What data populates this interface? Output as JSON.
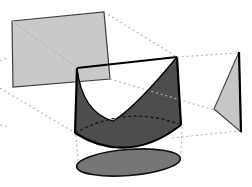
{
  "canvas": {
    "width": 252,
    "height": 187,
    "background": "#ffffff"
  },
  "colors": {
    "background": "#ffffff",
    "projection_plane_fill": "#c9c9c9",
    "projection_plane_stroke": "#3f3f3f",
    "solid_lateral_fill": "#4d4d4d",
    "solid_front_face_fill": "#ffffff",
    "solid_edge_stroke": "#000000",
    "side_triangle_fill": "#c6c6c6",
    "side_triangle_stroke": "#4a4a4a",
    "shadow_ellipse_fill": "#767676",
    "shadow_ellipse_stroke": "#111111",
    "projection_ray_color": "#b4b4b4",
    "hidden_edge_color": "#111111"
  },
  "figure": {
    "description_names": [
      "back-projection-plane",
      "parabolic-cylinder-solid",
      "side-projection-triangle",
      "bottom-shadow-ellipse",
      "projection-rays-dotted"
    ]
  },
  "layers": [
    {
      "name": "solid-front-face",
      "type": "path",
      "d": "M 77,68 L 177,57 Q 135,108 113,121 Q 82,112 77,68 Z",
      "fill": "#ffffff"
    },
    {
      "name": "back-projection-plane",
      "type": "polygon",
      "points": "12,21 104,12 110,79 13,87",
      "fill": "#c9c9c9",
      "stroke": "#3f3f3f",
      "stroke_width": 1.2
    },
    {
      "name": "ray-back-top-left",
      "type": "line",
      "x1": 12,
      "y1": 21,
      "x2": 77,
      "y2": 68,
      "stroke": "#b4b4b4",
      "stroke_width": 1.1,
      "dash": "2,2.8"
    },
    {
      "name": "ray-back-top-right",
      "type": "line",
      "x1": 104,
      "y1": 12,
      "x2": 177,
      "y2": 57,
      "stroke": "#b4b4b4",
      "stroke_width": 1.1,
      "dash": "2,2.8"
    },
    {
      "name": "ray-back-bottom-left",
      "type": "line",
      "x1": 0,
      "y1": 88,
      "x2": 75,
      "y2": 133,
      "stroke": "#b4b4b4",
      "stroke_width": 1.1,
      "dash": "2,2.8"
    },
    {
      "name": "ray-stub-left-top",
      "type": "line",
      "x1": 0,
      "y1": 61,
      "x2": 9,
      "y2": 57,
      "stroke": "#b4b4b4",
      "stroke_width": 1.1,
      "dash": "2,2.8"
    },
    {
      "name": "ray-stub-left-bottom",
      "type": "line",
      "x1": 0,
      "y1": 125,
      "x2": 9,
      "y2": 127,
      "stroke": "#b4b4b4",
      "stroke_width": 1.1,
      "dash": "2,2.8"
    },
    {
      "name": "solid-lateral-surface",
      "type": "path",
      "d": "M 77,68 L 177,57 L 181,125 Q 128,166 75,133 Z M 77,68 Q 82,112 113,121 Q 135,108 177,57 Z",
      "fill": "#4d4d4d",
      "fill_rule": "evenodd"
    },
    {
      "name": "ray-side-middle",
      "type": "line",
      "x1": 110,
      "y1": 79,
      "x2": 214,
      "y2": 110,
      "stroke": "#b4b4b4",
      "stroke_width": 1.1,
      "dash": "2,2.8"
    },
    {
      "name": "solid-hidden-bottom-rim",
      "type": "path",
      "d": "M 75,133 Q 128,104 181,125",
      "fill": "none",
      "stroke": "#111111",
      "stroke_width": 1.2,
      "dash": "3,2.6"
    },
    {
      "name": "solid-edge-top",
      "type": "path",
      "d": "M 77,68 L 177,57",
      "fill": "none",
      "stroke": "#000000",
      "stroke_width": 2.2
    },
    {
      "name": "solid-edge-left",
      "type": "path",
      "d": "M 77,68 L 75,133",
      "fill": "none",
      "stroke": "#000000",
      "stroke_width": 2.2
    },
    {
      "name": "solid-edge-right",
      "type": "path",
      "d": "M 177,57 L 181,125",
      "fill": "none",
      "stroke": "#000000",
      "stroke_width": 2.2
    },
    {
      "name": "solid-edge-bottom-rim",
      "type": "path",
      "d": "M 75,133 Q 128,166 181,125",
      "fill": "none",
      "stroke": "#000000",
      "stroke_width": 2.2
    },
    {
      "name": "solid-parabola-curve",
      "type": "path",
      "d": "M 177,57 Q 135,108 113,121 Q 82,112 77,68",
      "fill": "none",
      "stroke": "#000000",
      "stroke_width": 1.3
    },
    {
      "name": "ray-side-top",
      "type": "line",
      "x1": 177,
      "y1": 57,
      "x2": 239,
      "y2": 53,
      "stroke": "#b4b4b4",
      "stroke_width": 1.1,
      "dash": "2,2.8"
    },
    {
      "name": "ray-side-bottom",
      "type": "line",
      "x1": 172,
      "y1": 138,
      "x2": 239,
      "y2": 131,
      "stroke": "#b4b4b4",
      "stroke_width": 1.1,
      "dash": "2,2.8"
    },
    {
      "name": "side-projection-triangle",
      "type": "polygon",
      "points": "239,52 214,109 241,132",
      "fill": "#c6c6c6",
      "stroke": "#4a4a4a",
      "stroke_width": 1.2
    },
    {
      "name": "side-triangle-right-edge",
      "type": "line",
      "x1": 239,
      "y1": 52,
      "x2": 241,
      "y2": 132,
      "stroke": "#000000",
      "stroke_width": 2.2
    },
    {
      "name": "bottom-shadow-ellipse",
      "type": "ellipse",
      "cx": 128.5,
      "cy": 162.5,
      "rx": 52,
      "ry": 13,
      "rotate": -4.5,
      "fill": "#767676",
      "stroke": "#111111",
      "stroke_width": 1.6
    },
    {
      "name": "ray-down-left",
      "type": "line",
      "x1": 76,
      "y1": 135,
      "x2": 78,
      "y2": 161,
      "stroke": "#b4b4b4",
      "stroke_width": 1.1,
      "dash": "2,2.8"
    },
    {
      "name": "ray-down-right",
      "type": "line",
      "x1": 182,
      "y1": 127,
      "x2": 181,
      "y2": 154,
      "stroke": "#b4b4b4",
      "stroke_width": 1.1,
      "dash": "2,2.8"
    }
  ]
}
